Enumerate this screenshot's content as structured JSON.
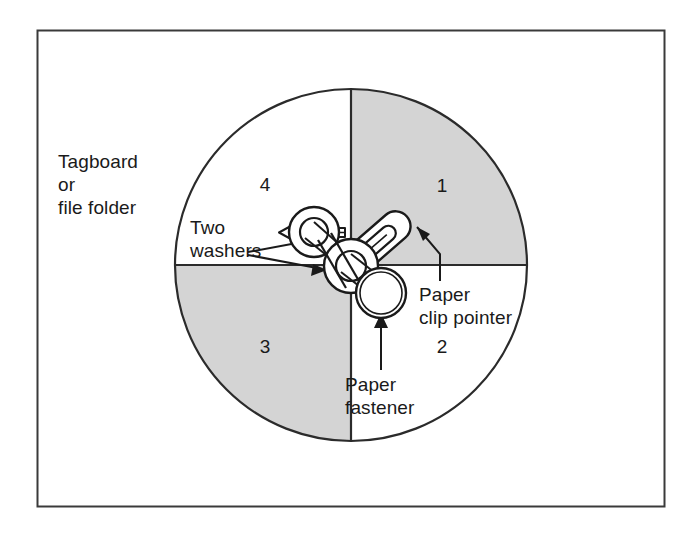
{
  "figure": {
    "frame": {
      "name": "outer-border",
      "x": 37,
      "y": 30,
      "width": 627,
      "height": 476,
      "stroke_color": "#3a3a3a"
    },
    "spinner": {
      "center_x": 351,
      "center_y": 265,
      "radius": 176,
      "outline_color": "#2b2b2b",
      "shaded_fill": "#d4d4d4",
      "unshaded_fill": "#ffffff",
      "quadrants": [
        {
          "number": "1",
          "position": "top-right",
          "shaded": true
        },
        {
          "number": "2",
          "position": "bottom-right",
          "shaded": false
        },
        {
          "number": "3",
          "position": "bottom-left",
          "shaded": true
        },
        {
          "number": "4",
          "position": "top-left",
          "shaded": false
        }
      ]
    },
    "labels": {
      "material": "Tagboard\nor\nfile folder",
      "two_washers": "Two\nwashers",
      "paper_clip_pointer": "Paper\nclip pointer",
      "paper_fastener": "Paper\nfastener"
    },
    "callouts": [
      {
        "name": "two-washers-callout",
        "style": "hollow-arrow-and-two-thin-arrows",
        "points_to": "washers-on-fastener"
      },
      {
        "name": "paper-clip-pointer-callout",
        "style": "thin-arrow",
        "points_to": "paper-clip"
      },
      {
        "name": "paper-fastener-callout",
        "style": "thin-arrow",
        "points_to": "fastener-head-ring"
      }
    ],
    "parts": [
      {
        "name": "paper-clip",
        "description": "wire paper clip used as the spinner pointer, angled toward quadrant 1"
      },
      {
        "name": "washer-upper",
        "description": "upper washer ring"
      },
      {
        "name": "washer-lower",
        "description": "lower washer ring at the spinner center"
      },
      {
        "name": "fastener-ring",
        "description": "round paper fastener head below center"
      },
      {
        "name": "fastener-prongs",
        "description": "flat split prongs extending left from the washers"
      }
    ]
  }
}
